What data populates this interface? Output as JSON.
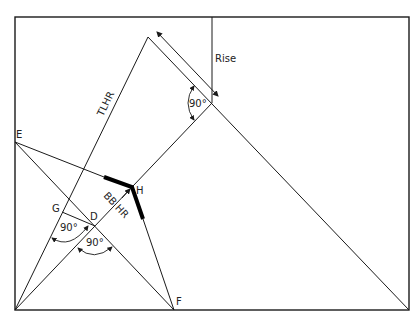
{
  "diagram": {
    "labels": {
      "rise": "Rise",
      "tlhr": "TLHR",
      "bbhr": "BB HR",
      "E": "E",
      "G": "G",
      "D": "D",
      "H": "H",
      "F": "F"
    },
    "angles": {
      "top_right_angle": "90°",
      "g_angle": "90°",
      "d_angle": "90°"
    }
  }
}
